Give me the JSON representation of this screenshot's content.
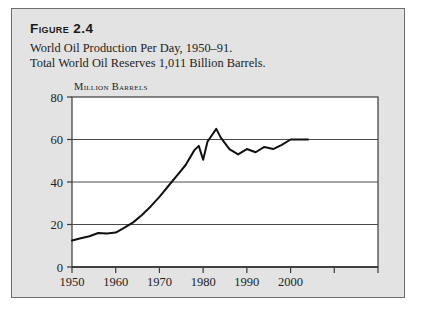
{
  "figure": {
    "title": "Figure 2.4",
    "subtitle": "World Oil Production Per Day, 1950–91.\nTotal World Oil Reserves 1,011 Billion Barrels."
  },
  "chart_data": {
    "type": "line",
    "title": "World Oil Production Per Day, 1950–91.",
    "xlabel": "",
    "ylabel": "Million Barrels",
    "unit_label": "Million Barrels",
    "xlim": [
      1950,
      2020
    ],
    "ylim": [
      0,
      80
    ],
    "yticks": [
      0,
      20,
      40,
      60,
      80
    ],
    "ytick_labels": [
      "0",
      "20",
      "40",
      "60",
      "80"
    ],
    "xticks": [
      1950,
      1960,
      1970,
      1980,
      1990,
      2000,
      2010,
      2020
    ],
    "xtick_labels": [
      "1950",
      "1960",
      "1970",
      "1980",
      "1990",
      "2000",
      "",
      ""
    ],
    "gridlines_y": [
      20,
      40,
      60
    ],
    "grid": true,
    "legend": null,
    "series": [
      {
        "name": "World Oil Production Per Day",
        "x": [
          1950,
          1952,
          1954,
          1956,
          1958,
          1960,
          1962,
          1964,
          1966,
          1968,
          1970,
          1972,
          1974,
          1976,
          1978,
          1979,
          1980,
          1981,
          1982,
          1983,
          1984,
          1986,
          1988,
          1990,
          1992,
          1994,
          1996,
          1998,
          2000,
          2002,
          2004
        ],
        "values": [
          12.5,
          13.5,
          14.5,
          16.0,
          15.8,
          16.2,
          18.5,
          21.0,
          24.5,
          28.5,
          33.0,
          38.0,
          43.0,
          48.0,
          55.0,
          57.0,
          50.5,
          59.0,
          62.0,
          65.0,
          61.0,
          55.5,
          53.0,
          55.5,
          54.0,
          56.5,
          55.5,
          57.5,
          60.0,
          60.0,
          60.0
        ]
      }
    ]
  }
}
